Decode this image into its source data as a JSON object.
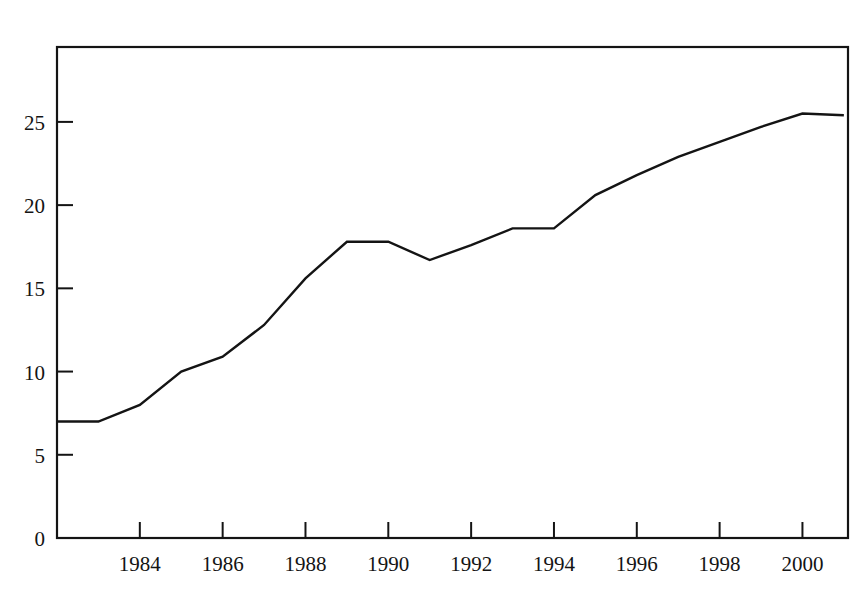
{
  "chart_data": {
    "type": "line",
    "title": "Hours per person",
    "ylabel": "Hours per person",
    "xlabel": "",
    "x": [
      1982,
      1983,
      1984,
      1985,
      1986,
      1987,
      1988,
      1989,
      1990,
      1991,
      1992,
      1993,
      1994,
      1995,
      1996,
      1997,
      1998,
      1999,
      2000,
      2001
    ],
    "values": [
      7.0,
      7.0,
      8.0,
      10.0,
      10.9,
      12.8,
      15.6,
      17.8,
      17.8,
      16.7,
      17.6,
      18.6,
      18.6,
      20.6,
      21.8,
      22.9,
      23.8,
      24.7,
      25.5,
      25.4
    ],
    "series": [
      {
        "name": "Hours per person",
        "values": [
          7.0,
          7.0,
          8.0,
          10.0,
          10.9,
          12.8,
          15.6,
          17.8,
          17.8,
          16.7,
          17.6,
          18.6,
          18.6,
          20.6,
          21.8,
          22.9,
          23.8,
          24.7,
          25.5,
          25.4
        ]
      }
    ],
    "ylim": [
      0,
      29.5
    ],
    "xlim": [
      1982,
      2001.1
    ],
    "yticks": [
      0,
      5,
      10,
      15,
      20,
      25
    ],
    "ytick_labels": [
      "0",
      "5",
      "10",
      "15",
      "20",
      "25"
    ],
    "xticks": [
      1984,
      1986,
      1988,
      1990,
      1992,
      1994,
      1996,
      1998,
      2000
    ],
    "xtick_labels": [
      "1984",
      "1986",
      "1988",
      "1990",
      "1992",
      "1994",
      "1996",
      "1998",
      "2000"
    ],
    "grid": false,
    "legend": false,
    "legend_position": "none",
    "line_color": "#141414",
    "frame_color": "#141414",
    "background_color": "#ffffff",
    "tick_direction": "in",
    "frame_style": "full-box"
  }
}
